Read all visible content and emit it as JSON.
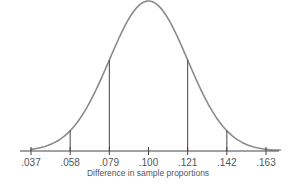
{
  "chart_data": {
    "type": "line",
    "title": "",
    "subtitle": "Normal sampling distribution",
    "xlabel": "Difference in sample proportions",
    "ylabel": "",
    "x_ticks": [
      ".037",
      ".058",
      ".079",
      ".100",
      ".121",
      ".142",
      ".163"
    ],
    "x_values": [
      0.037,
      0.058,
      0.079,
      0.1,
      0.121,
      0.142,
      0.163
    ],
    "mean": 0.1,
    "std_dev": 0.021,
    "reference_lines": [
      {
        "x": 0.058,
        "label": "mean - 2 SD"
      },
      {
        "x": 0.079,
        "label": "mean - 1 SD"
      },
      {
        "x": 0.121,
        "label": "mean + 1 SD"
      },
      {
        "x": 0.142,
        "label": "mean + 2 SD"
      }
    ],
    "xlim": [
      0.031,
      0.169
    ],
    "grid": false,
    "legend": "none"
  },
  "colors": {
    "curve": "#8a8a8a",
    "axis": "#444444",
    "reference_line": "#444444",
    "text": "#555555"
  }
}
